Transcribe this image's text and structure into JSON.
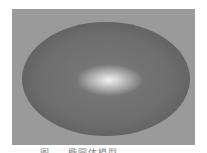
{
  "figure": {
    "background_color": "#9a9a9a",
    "ellipse_color": "#6e6e6e",
    "highlight_color": "#f4f4f4",
    "caption": "图 … 椭圆体模型"
  }
}
